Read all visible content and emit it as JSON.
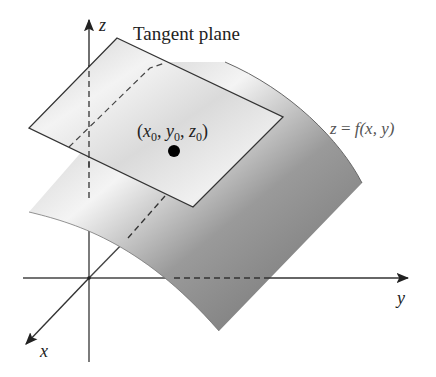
{
  "diagram": {
    "title": "Tangent plane",
    "axes": {
      "z": "z",
      "y": "y",
      "x": "x"
    },
    "surface_label": {
      "lhs": "z",
      "eq": " = ",
      "func": "f",
      "args": "(x, y)"
    },
    "point_label": {
      "open": "(",
      "x": "x",
      "x_sub": "0",
      "sep1": ", ",
      "y": "y",
      "y_sub": "0",
      "sep2": ", ",
      "z": "z",
      "z_sub": "0",
      "close": ")"
    },
    "colors": {
      "axis": "#333333",
      "plane_fill_light": "#e8e8e8",
      "surface_dark": "#777777",
      "point": "#000000"
    }
  }
}
